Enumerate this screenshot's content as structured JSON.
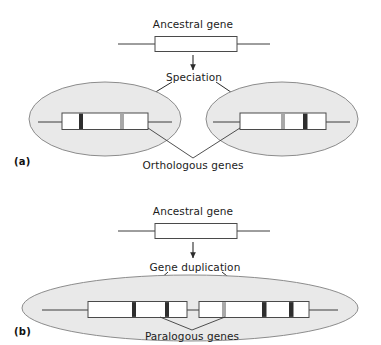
{
  "figure": {
    "title_panels": [
      "a",
      "b"
    ],
    "colors": {
      "ellipse_fill": "#e9e9e9",
      "ellipse_stroke": "#8c8c8c",
      "gene_box_fill": "#ffffff",
      "gene_box_stroke": "#4a4a4a",
      "bar_dark": "#2e2e2e",
      "bar_light": "#a8a8a8",
      "line": "#3c3c3c",
      "text": "#1c1c1c",
      "background": "#ffffff"
    }
  },
  "panel_a": {
    "tag": "(a)",
    "ancestral_label": "Ancestral gene",
    "process_label": "Speciation",
    "result_label": "Orthologous genes",
    "ancestral_gene": {
      "bars": []
    },
    "species_left": {
      "name": "species-1-ellipse",
      "gene_bars": [
        {
          "pos": 0.22,
          "shade": "dark"
        },
        {
          "pos": 0.68,
          "shade": "light"
        }
      ]
    },
    "species_right": {
      "name": "species-2-ellipse",
      "gene_bars": [
        {
          "pos": 0.48,
          "shade": "light"
        },
        {
          "pos": 0.72,
          "shade": "dark"
        }
      ]
    }
  },
  "panel_b": {
    "tag": "(b)",
    "ancestral_label": "Ancestral gene",
    "process_label": "Gene duplication",
    "result_label": "Paralogous genes",
    "ancestral_gene": {
      "bars": []
    },
    "species": {
      "name": "single-species-ellipse",
      "gene_copy_1": {
        "bars": [
          {
            "pos": 0.45,
            "shade": "dark"
          },
          {
            "pos": 0.78,
            "shade": "dark"
          }
        ]
      },
      "gene_copy_2": {
        "bars": [
          {
            "pos": 0.22,
            "shade": "light"
          },
          {
            "pos": 0.58,
            "shade": "dark"
          },
          {
            "pos": 0.82,
            "shade": "dark"
          }
        ]
      }
    }
  }
}
